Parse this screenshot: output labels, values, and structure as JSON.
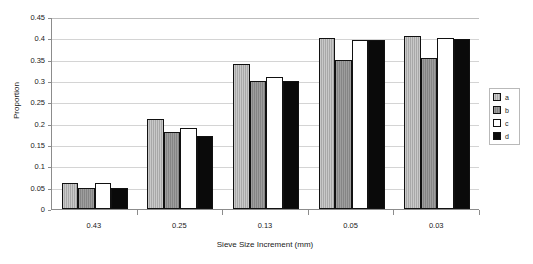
{
  "chart_data": {
    "type": "bar",
    "title": "",
    "subtitle": "",
    "xlabel": "Sieve Size Increment (mm)",
    "ylabel": "Proportion",
    "categories": [
      "0.43",
      "0.25",
      "0.13",
      "0.05",
      "0.03"
    ],
    "series": [
      {
        "name": "a",
        "color": "#b2b2b2",
        "values": [
          0.06,
          0.21,
          0.34,
          0.4,
          0.405
        ]
      },
      {
        "name": "b",
        "color": "#8c8c8c",
        "values": [
          0.05,
          0.18,
          0.3,
          0.35,
          0.355
        ]
      },
      {
        "name": "c",
        "color": "#ffffff",
        "values": [
          0.06,
          0.19,
          0.31,
          0.395,
          0.4
        ]
      },
      {
        "name": "d",
        "color": "#0a0a0a",
        "values": [
          0.05,
          0.17,
          0.3,
          0.395,
          0.398
        ]
      }
    ],
    "ylim": [
      0,
      0.45
    ],
    "yticks": [
      "0",
      "0.05",
      "0.1",
      "0.15",
      "0.2",
      "0.25",
      "0.3",
      "0.35",
      "0.4",
      "0.45"
    ],
    "ytick_values": [
      0,
      0.05,
      0.1,
      0.15,
      0.2,
      0.25,
      0.3,
      0.35,
      0.4,
      0.45
    ],
    "grid": "horizontal",
    "legend_position": "right",
    "legend_entries": [
      "a",
      "b",
      "c",
      "d"
    ]
  },
  "axes": {
    "y_title": "Proportion",
    "x_title": "Sieve Size Increment (mm)"
  }
}
